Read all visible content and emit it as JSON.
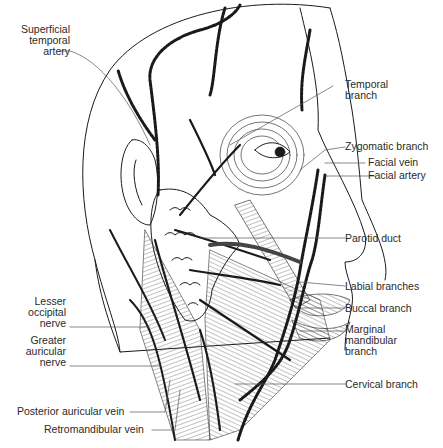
{
  "figure": {
    "labels_left": [
      {
        "id": "superficial-temporal-artery",
        "text": "Superficial\ntemporal\nartery"
      },
      {
        "id": "lesser-occipital-nerve",
        "text": "Lesser\noccipital\nnerve"
      },
      {
        "id": "greater-auricular-nerve",
        "text": "Greater\nauricular\nnerve"
      },
      {
        "id": "posterior-auricular-vein",
        "text": "Posterior auricular vein"
      },
      {
        "id": "retromandibular-vein",
        "text": "Retromandibular vein"
      }
    ],
    "labels_right": [
      {
        "id": "temporal-branch",
        "text": "Temporal\nbranch"
      },
      {
        "id": "zygomatic-branch",
        "text": "Zygomatic branch"
      },
      {
        "id": "facial-vein",
        "text": "Facial vein"
      },
      {
        "id": "facial-artery",
        "text": "Facial artery"
      },
      {
        "id": "parotid-duct",
        "text": "Parotid duct"
      },
      {
        "id": "labial-branches",
        "text": "Labial branches"
      },
      {
        "id": "buccal-branch",
        "text": "Buccal branch"
      },
      {
        "id": "marginal-mandibular-branch",
        "text": "Marginal\nmandibular\nbranch"
      },
      {
        "id": "cervical-branch",
        "text": "Cervical branch"
      }
    ],
    "colors": {
      "line": "#1a1a1a",
      "background": "#ffffff",
      "text": "#2a2a2a"
    }
  }
}
